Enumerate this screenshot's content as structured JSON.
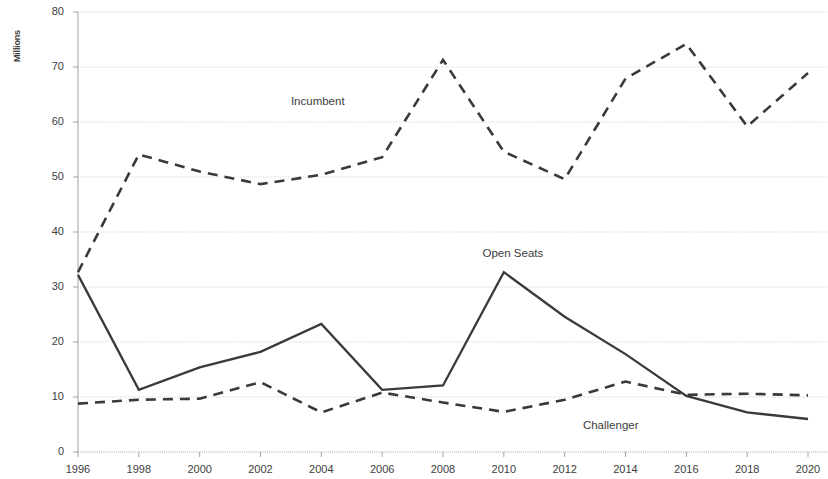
{
  "chart_data": {
    "type": "line",
    "title": "",
    "subtitle": "",
    "xlabel": "",
    "ylabel": "Millions",
    "x": [
      1996,
      1998,
      2000,
      2002,
      2004,
      2006,
      2008,
      2010,
      2012,
      2014,
      2016,
      2018,
      2020
    ],
    "categories": [
      "1996",
      "1998",
      "2000",
      "2002",
      "2004",
      "2006",
      "2008",
      "2010",
      "2012",
      "2014",
      "2016",
      "2018",
      "2020"
    ],
    "xlim": [
      1996,
      2020
    ],
    "ylim": [
      0,
      80
    ],
    "yticks": [
      0,
      10,
      20,
      30,
      40,
      50,
      60,
      70,
      80
    ],
    "grid": true,
    "legend": "inline-annotations",
    "series": [
      {
        "name": "Incumbent",
        "style": "dashed",
        "color": "#3a3a3a",
        "values": [
          32.7,
          54.1,
          51.0,
          48.7,
          50.4,
          53.6,
          71.3,
          54.6,
          49.6,
          67.9,
          74.2,
          59.2,
          68.9
        ]
      },
      {
        "name": "Open Seats",
        "style": "solid",
        "color": "#3a3a3a",
        "values": [
          32.2,
          11.3,
          15.4,
          18.2,
          23.3,
          11.3,
          12.1,
          32.7,
          24.6,
          17.8,
          10.2,
          7.2,
          6.0
        ]
      },
      {
        "name": "Challenger",
        "style": "dashed",
        "color": "#3a3a3a",
        "values": [
          8.8,
          9.5,
          9.7,
          12.7,
          7.2,
          10.8,
          9.0,
          7.3,
          9.5,
          12.8,
          10.4,
          10.6,
          10.3
        ]
      }
    ],
    "annotations": [
      {
        "text": "Incumbent",
        "x": 2003.0,
        "y": 63.5
      },
      {
        "text": "Open Seats",
        "x": 2009.3,
        "y": 35.9
      },
      {
        "text": "Challenger",
        "x": 2012.6,
        "y": 4.6
      }
    ],
    "axis_color": "#9a9a9a",
    "grid_color": "#c9c9c9",
    "background": "#ffffff"
  },
  "plot_geometry": {
    "left": 78,
    "right": 808,
    "top": 12,
    "bottom": 452
  }
}
